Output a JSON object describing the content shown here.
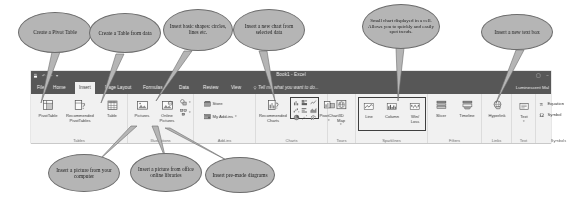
{
  "app": {
    "title": "Book1 - Excel",
    "account": "Luminescent Mal",
    "ribbon_display_icon": "ribbon-display-options-icon",
    "minimize_icon": "minimize-icon"
  },
  "quick_access": [
    "save-icon",
    "undo-icon",
    "redo-icon",
    "customize-qat-icon"
  ],
  "tabs": [
    {
      "label": "File",
      "active": false
    },
    {
      "label": "Home",
      "active": false
    },
    {
      "label": "Insert",
      "active": true
    },
    {
      "label": "Page Layout",
      "active": false
    },
    {
      "label": "Formulas",
      "active": false
    },
    {
      "label": "Data",
      "active": false
    },
    {
      "label": "Review",
      "active": false
    },
    {
      "label": "View",
      "active": false
    }
  ],
  "tell_me": "Tell me what you want to do...",
  "groups": [
    {
      "name": "Tables",
      "label": "Tables",
      "commands": [
        {
          "label": "PivotTable",
          "icon": "pivottable-icon"
        },
        {
          "label": "Recommended\nPivotTables",
          "icon": "recommended-pivottables-icon"
        },
        {
          "label": "Table",
          "icon": "table-icon"
        }
      ]
    },
    {
      "name": "Illustrations",
      "label": "Illustrations",
      "commands": [
        {
          "label": "Pictures",
          "icon": "pictures-icon"
        },
        {
          "label": "Online\nPictures",
          "icon": "online-pictures-icon"
        },
        {
          "label": "Shapes",
          "icon": "shapes-icon"
        },
        {
          "label": "SmartArt",
          "icon": "smartart-icon"
        }
      ]
    },
    {
      "name": "Add-ins",
      "label": "Add-ins",
      "commands": [
        {
          "label": "Store",
          "icon": "store-icon"
        },
        {
          "label": "My Add-ins",
          "icon": "my-addins-icon"
        }
      ]
    },
    {
      "name": "Charts",
      "label": "Charts",
      "commands": [
        {
          "label": "Recommended\nCharts",
          "icon": "recommended-charts-icon"
        },
        {
          "label": "PivotChart",
          "icon": "pivotchart-icon"
        }
      ]
    },
    {
      "name": "Tours",
      "label": "Tours",
      "commands": [
        {
          "label": "3D\nMap",
          "icon": "3d-map-icon"
        }
      ]
    },
    {
      "name": "Sparklines",
      "label": "Sparklines",
      "commands": [
        {
          "label": "Line",
          "icon": "sparkline-line-icon"
        },
        {
          "label": "Column",
          "icon": "sparkline-column-icon"
        },
        {
          "label": "Win/\nLoss",
          "icon": "sparkline-winloss-icon"
        }
      ]
    },
    {
      "name": "Filters",
      "label": "Filters",
      "commands": [
        {
          "label": "Slicer",
          "icon": "slicer-icon"
        },
        {
          "label": "Timeline",
          "icon": "timeline-icon"
        }
      ]
    },
    {
      "name": "Links",
      "label": "Links",
      "commands": [
        {
          "label": "Hyperlink",
          "icon": "hyperlink-icon"
        }
      ]
    },
    {
      "name": "Text",
      "label": "Text",
      "commands": [
        {
          "label": "Text",
          "icon": "text-box-icon"
        }
      ]
    },
    {
      "name": "Symbols",
      "label": "Symbols",
      "commands": [
        {
          "label": "Equation",
          "icon": "equation-icon"
        },
        {
          "label": "Symbol",
          "icon": "symbol-icon"
        }
      ]
    }
  ],
  "callouts": [
    {
      "id": "pivot-table",
      "text": "Create a Pivot Table"
    },
    {
      "id": "table-from-data",
      "text": "Create a Table from data"
    },
    {
      "id": "basic-shapes",
      "text": "Insert basic shapes: circles, lines etc."
    },
    {
      "id": "new-chart",
      "text": "Insert a new chart from selected data"
    },
    {
      "id": "sparkline",
      "text": "Small chart displayed in a cell. Allows you to quickly and easily spot trends."
    },
    {
      "id": "text-box",
      "text": "Insert a new text box"
    },
    {
      "id": "picture-computer",
      "text": "Insert a picture from your computer"
    },
    {
      "id": "picture-online",
      "text": "Insert a picture from office online libraries"
    },
    {
      "id": "premade-diagram",
      "text": "Insert pre-made diagrams"
    }
  ],
  "colors": {
    "bubble_fill": "#b5b5b5",
    "bubble_stroke": "#6d6d6d",
    "titlebar": "#575757",
    "ribbon_bg": "#f1f1f1"
  }
}
